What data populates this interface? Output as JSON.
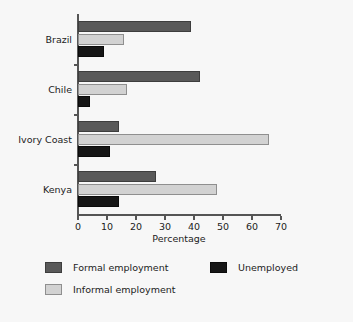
{
  "chart_data": {
    "type": "bar",
    "orientation": "horizontal",
    "title": "",
    "xlabel": "Percentage",
    "ylabel": "",
    "xlim": [
      0,
      70
    ],
    "xticks": [
      0,
      10,
      20,
      30,
      40,
      50,
      60,
      70
    ],
    "grid": false,
    "legend_position": "bottom",
    "categories": [
      "Brazil",
      "Chile",
      "Ivory Coast",
      "Kenya"
    ],
    "series": [
      {
        "name": "Formal employment",
        "color": "#595959",
        "values": [
          39,
          42,
          14,
          27
        ]
      },
      {
        "name": "Informal employment",
        "color": "#d2d2d2",
        "values": [
          16,
          17,
          66,
          48
        ]
      },
      {
        "name": "Unemployed",
        "color": "#161616",
        "values": [
          9,
          4,
          11,
          14
        ]
      }
    ]
  },
  "axis": {
    "x_tick_labels": [
      "0",
      "10",
      "20",
      "30",
      "40",
      "50",
      "60",
      "70"
    ],
    "x_title": "Percentage"
  },
  "legend": {
    "entries": [
      {
        "label": "Formal employment",
        "swatch": "formal"
      },
      {
        "label": "Unemployed",
        "swatch": "unemp"
      },
      {
        "label": "Informal employment",
        "swatch": "informal"
      }
    ]
  },
  "colors": {
    "background": "#f7f7f7",
    "axis": "#555555",
    "text": "#1c1c1c",
    "formal": "#595959",
    "informal": "#d2d2d2",
    "unemployed": "#161616"
  }
}
